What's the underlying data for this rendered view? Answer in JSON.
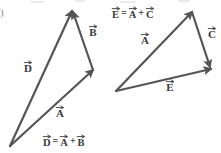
{
  "figure": {
    "label_fragment": ")",
    "background_color": "#ffffff",
    "stroke_color": "#555555",
    "text_color": "#3a3a3a"
  },
  "diagrams": [
    {
      "id": "left-triangle",
      "name": "vector-addition-d-equals-a-plus-b",
      "equation": {
        "lhs": "D",
        "op1": "=",
        "rhs1": "A",
        "op2": "+",
        "rhs2": "B",
        "x": 43,
        "y": 141
      },
      "vectors": [
        {
          "name": "A",
          "label": "A",
          "x1": 10,
          "y1": 146,
          "x2": 93,
          "y2": 70,
          "label_x": 60,
          "label_y": 112
        },
        {
          "name": "B",
          "label": "B",
          "x1": 93,
          "y1": 70,
          "x2": 73,
          "y2": 12,
          "label_x": 93,
          "label_y": 31
        },
        {
          "name": "D",
          "label": "D",
          "x1": 10,
          "y1": 146,
          "x2": 72,
          "y2": 11,
          "label_x": 28,
          "label_y": 67
        }
      ]
    },
    {
      "id": "right-triangle",
      "name": "vector-addition-e-equals-a-plus-c",
      "equation": {
        "lhs": "E",
        "op1": "=",
        "rhs1": "A",
        "op2": "+",
        "rhs2": "C",
        "x": 112,
        "y": 13
      },
      "vectors": [
        {
          "name": "A",
          "label": "A",
          "x1": 116,
          "y1": 91,
          "x2": 192,
          "y2": 12,
          "label_x": 145,
          "label_y": 39
        },
        {
          "name": "C",
          "label": "C",
          "x1": 192,
          "y1": 12,
          "x2": 210,
          "y2": 67,
          "label_x": 212,
          "label_y": 33
        },
        {
          "name": "E",
          "label": "E",
          "x1": 116,
          "y1": 91,
          "x2": 211,
          "y2": 69,
          "label_x": 170,
          "label_y": 86
        }
      ]
    }
  ]
}
